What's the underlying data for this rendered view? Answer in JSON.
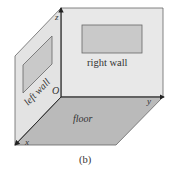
{
  "diagram": {
    "caption": "(b)",
    "labels": {
      "right_wall": "right wall",
      "left_wall": "left wall",
      "floor": "floor",
      "origin": "O",
      "axis_x": "x",
      "axis_y": "y",
      "axis_z": "z"
    },
    "colors": {
      "wall_fill": "#e6e6e6",
      "floor_fill": "#b9b9b9",
      "window_fill": "#c9c9c9",
      "edge": "#555555"
    }
  }
}
